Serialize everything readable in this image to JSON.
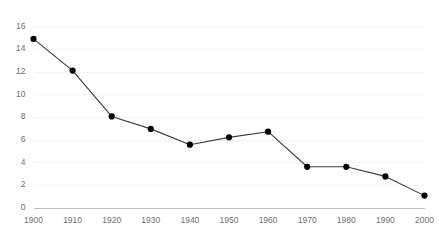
{
  "chart_data": {
    "type": "line",
    "title": "",
    "subtitle": "",
    "xlabel": "",
    "ylabel": "",
    "categories": [
      "1900",
      "1910",
      "1920",
      "1930",
      "1940",
      "1950",
      "1960",
      "1970",
      "1980",
      "1990",
      "2000"
    ],
    "x": [
      1900,
      1910,
      1920,
      1930,
      1940,
      1950,
      1960,
      1970,
      1980,
      1990,
      2000
    ],
    "values": [
      14.9,
      12.1,
      8.05,
      6.95,
      5.55,
      6.2,
      6.7,
      3.6,
      3.6,
      2.75,
      1.05
    ],
    "series": [
      {
        "name": "",
        "values": [
          14.9,
          12.1,
          8.05,
          6.95,
          5.55,
          6.2,
          6.7,
          3.6,
          3.6,
          2.75,
          1.05
        ]
      }
    ],
    "xlim": [
      1900,
      2000
    ],
    "ylim": [
      0,
      16
    ],
    "ytick_labels": [
      "0",
      "2",
      "4",
      "6",
      "8",
      "10",
      "12",
      "14",
      "16"
    ],
    "yticks": [
      0,
      2,
      4,
      6,
      8,
      10,
      12,
      14,
      16
    ],
    "xtick_labels": [
      "1900",
      "1910",
      "1920",
      "1930",
      "1940",
      "1950",
      "1960",
      "1970",
      "1980",
      "1990",
      "2000"
    ],
    "grid": true,
    "grid_axis": "y",
    "legend": false,
    "legend_position": "none",
    "marker": "circle",
    "annotations": [],
    "colors": {
      "background": "#ffffff",
      "line": "#3b3b3b",
      "marker": "#000000",
      "gridline": "#f2f2f3",
      "axis": "#bdbdc2",
      "tick_label": "#6e6e73"
    }
  }
}
